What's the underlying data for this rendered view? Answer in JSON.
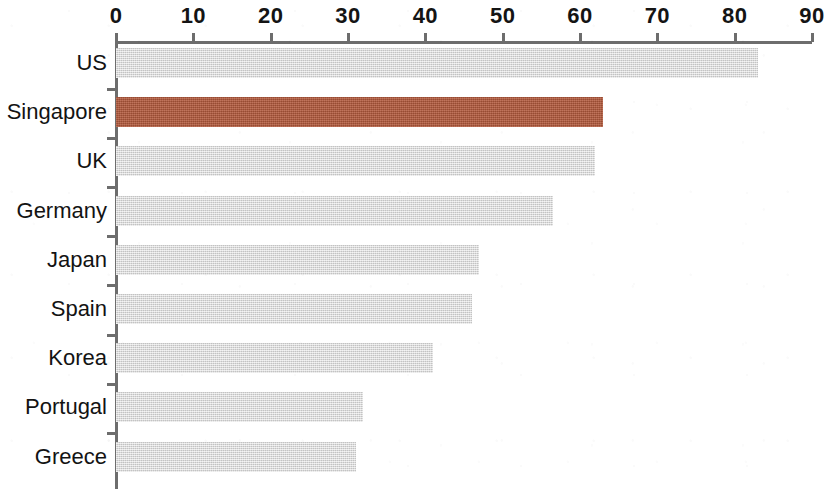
{
  "chart_data": {
    "type": "bar",
    "orientation": "horizontal",
    "title": "",
    "subtitle": "",
    "xlabel": "",
    "ylabel": "",
    "xlim": [
      0,
      90
    ],
    "ylim": null,
    "grid": false,
    "legend": null,
    "legend_position": "none",
    "x_ticks": [
      0,
      10,
      20,
      30,
      40,
      50,
      60,
      70,
      80,
      90
    ],
    "x_tick_labels": [
      "0",
      "10",
      "20",
      "30",
      "40",
      "50",
      "60",
      "70",
      "80",
      "90"
    ],
    "categories": [
      "US",
      "Singapore",
      "UK",
      "Germany",
      "Japan",
      "Spain",
      "Korea",
      "Portugal",
      "Greece"
    ],
    "values": [
      83,
      63,
      62,
      56.5,
      47,
      46,
      41,
      32,
      31
    ],
    "highlight_category": "Singapore",
    "bar_color": "#d5d5d5",
    "highlight_color": "#b4593c",
    "axis_color": "#6d6d6d",
    "background_color": "#ffffff",
    "annotations": []
  },
  "axis": {
    "ticks": [
      {
        "label": "0",
        "value": 0
      },
      {
        "label": "10",
        "value": 10
      },
      {
        "label": "20",
        "value": 20
      },
      {
        "label": "30",
        "value": 30
      },
      {
        "label": "40",
        "value": 40
      },
      {
        "label": "50",
        "value": 50
      },
      {
        "label": "60",
        "value": 60
      },
      {
        "label": "70",
        "value": 70
      },
      {
        "label": "80",
        "value": 80
      },
      {
        "label": "90",
        "value": 90
      }
    ]
  },
  "bars": [
    {
      "label": "US",
      "value": 83,
      "highlight": false
    },
    {
      "label": "Singapore",
      "value": 63,
      "highlight": true
    },
    {
      "label": "UK",
      "value": 62,
      "highlight": false
    },
    {
      "label": "Germany",
      "value": 56.5,
      "highlight": false
    },
    {
      "label": "Japan",
      "value": 47,
      "highlight": false
    },
    {
      "label": "Spain",
      "value": 46,
      "highlight": false
    },
    {
      "label": "Korea",
      "value": 41,
      "highlight": false
    },
    {
      "label": "Portugal",
      "value": 32,
      "highlight": false
    },
    {
      "label": "Greece",
      "value": 31,
      "highlight": false
    }
  ]
}
